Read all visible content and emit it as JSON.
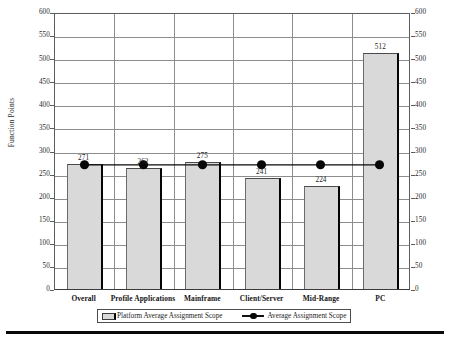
{
  "chart_data": {
    "type": "bar",
    "title": "",
    "subtitle": "",
    "xlabel": "",
    "ylabel": "Function Points",
    "ylim": [
      0,
      600
    ],
    "ytick_step": 50,
    "yticks": [
      600,
      550,
      500,
      450,
      400,
      350,
      300,
      250,
      200,
      150,
      100,
      50,
      0
    ],
    "grid": true,
    "grid_axis": "both",
    "dual_y_axis": true,
    "legend_position": "bottom",
    "categories": [
      "Overall",
      "Profile Applications",
      "Mainframe",
      "Client/Server",
      "Mid-Range",
      "PC"
    ],
    "series": [
      {
        "name": "Platform Average Assignment Scope",
        "type": "bar",
        "values": [
          271,
          262,
          275,
          241,
          224,
          512
        ],
        "value_labels": [
          "271",
          "262",
          "275",
          "241",
          "224",
          "512"
        ],
        "color": "#d9d9d9",
        "edge_color": "#050505"
      },
      {
        "name": "Average Assignment Scope",
        "type": "line",
        "values": [
          271,
          271,
          271,
          271,
          271,
          271
        ],
        "marker": "circle",
        "color": "#080808"
      }
    ]
  },
  "axes": {
    "y_left": {
      "label": "Function Points",
      "ticks": [
        "600",
        "550",
        "500",
        "450",
        "400",
        "350",
        "300",
        "250",
        "200",
        "150",
        "100",
        "50",
        "0"
      ]
    },
    "y_right": {
      "ticks": [
        "600",
        "550",
        "500",
        "450",
        "400",
        "350",
        "300",
        "250",
        "200",
        "150",
        "100",
        "50",
        "0"
      ]
    }
  },
  "legend": {
    "items": [
      {
        "label": "Platform Average Assignment Scope",
        "swatch": "bar-swatch"
      },
      {
        "label": "Average Assignment Scope",
        "swatch": "line-marker-swatch"
      }
    ]
  },
  "colors": {
    "bar_fill": "#d9d9d9",
    "bar_edge": "#050505",
    "marker": "#080808",
    "grid": "#8d8d8d",
    "axis": "#5c5c5c",
    "text": "#1a1a1a",
    "background": "#ffffff"
  }
}
